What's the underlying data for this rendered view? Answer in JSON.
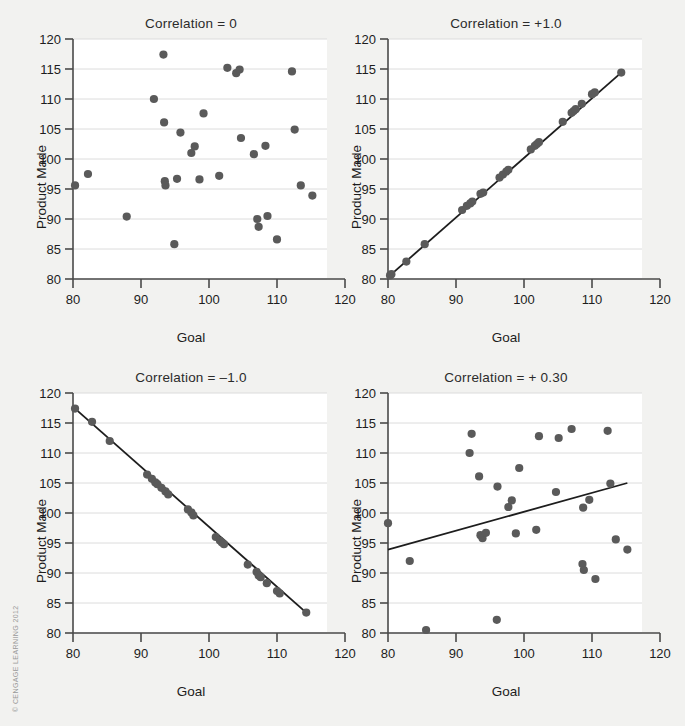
{
  "figure": {
    "background_color": "#f2f2f0",
    "plot_background_color": "#ffffff",
    "point_color": "#5a5a5a",
    "line_color": "#1d1d1d",
    "grid_color": "#dcdcdc",
    "axis_color": "#4a4a4a",
    "credit": "© CENGAGE LEARNING 2012"
  },
  "axes": {
    "xlabel": "Goal",
    "ylabel": "Product Made",
    "xticks": [
      80,
      90,
      100,
      110,
      120
    ],
    "yticks": [
      80,
      85,
      90,
      95,
      100,
      105,
      110,
      115,
      120
    ],
    "xlim": [
      80,
      120
    ],
    "ylim": [
      80,
      120
    ]
  },
  "chart_data": [
    {
      "type": "scatter",
      "title": "Correlation = 0",
      "xlabel": "Goal",
      "ylabel": "Product Made",
      "xlim": [
        80,
        120
      ],
      "ylim": [
        80,
        120
      ],
      "xticks": [
        80,
        90,
        100,
        110,
        120
      ],
      "yticks": [
        80,
        85,
        90,
        95,
        100,
        105,
        110,
        115,
        120
      ],
      "grid": "horizontal",
      "legend": "none",
      "correlation": 0,
      "trendline": null,
      "points": [
        [
          80.3,
          95.6
        ],
        [
          82.2,
          97.5
        ],
        [
          87.9,
          90.4
        ],
        [
          91.9,
          110.0
        ],
        [
          93.3,
          117.4
        ],
        [
          93.4,
          106.1
        ],
        [
          93.5,
          96.3
        ],
        [
          93.6,
          95.6
        ],
        [
          94.9,
          85.8
        ],
        [
          95.3,
          96.7
        ],
        [
          95.8,
          104.4
        ],
        [
          97.4,
          101.0
        ],
        [
          97.9,
          102.1
        ],
        [
          98.6,
          96.6
        ],
        [
          99.2,
          107.6
        ],
        [
          101.5,
          97.2
        ],
        [
          102.7,
          115.2
        ],
        [
          104.0,
          114.3
        ],
        [
          104.5,
          114.9
        ],
        [
          104.7,
          103.5
        ],
        [
          106.6,
          100.8
        ],
        [
          107.1,
          90.0
        ],
        [
          107.3,
          88.7
        ],
        [
          108.3,
          102.2
        ],
        [
          108.6,
          90.5
        ],
        [
          110.0,
          86.6
        ],
        [
          112.2,
          114.6
        ],
        [
          112.6,
          104.9
        ],
        [
          113.5,
          95.6
        ],
        [
          115.2,
          93.9
        ]
      ]
    },
    {
      "type": "scatter",
      "title": "Correlation = +1.0",
      "xlabel": "Goal",
      "ylabel": "Product Made",
      "xlim": [
        80,
        120
      ],
      "ylim": [
        80,
        120
      ],
      "xticks": [
        80,
        90,
        100,
        110,
        120
      ],
      "yticks": [
        80,
        85,
        90,
        95,
        100,
        105,
        110,
        115,
        120
      ],
      "grid": "horizontal",
      "legend": "none",
      "correlation": 1.0,
      "trendline": {
        "x": [
          80.3,
          114.3
        ],
        "y": [
          80.6,
          114.4
        ]
      },
      "points": [
        [
          80.3,
          80.6
        ],
        [
          80.5,
          80.8
        ],
        [
          82.7,
          82.9
        ],
        [
          85.4,
          85.8
        ],
        [
          90.9,
          91.5
        ],
        [
          91.6,
          92.2
        ],
        [
          92.1,
          92.6
        ],
        [
          92.4,
          92.9
        ],
        [
          93.6,
          94.2
        ],
        [
          94.0,
          94.4
        ],
        [
          96.4,
          96.9
        ],
        [
          96.9,
          97.4
        ],
        [
          97.4,
          97.9
        ],
        [
          97.7,
          98.2
        ],
        [
          101.0,
          101.6
        ],
        [
          101.6,
          102.2
        ],
        [
          101.9,
          102.5
        ],
        [
          102.2,
          102.8
        ],
        [
          105.7,
          106.2
        ],
        [
          107.0,
          107.7
        ],
        [
          107.3,
          108.0
        ],
        [
          107.6,
          108.3
        ],
        [
          108.5,
          109.2
        ],
        [
          110.0,
          110.8
        ],
        [
          110.4,
          111.1
        ],
        [
          114.3,
          114.4
        ]
      ]
    },
    {
      "type": "scatter",
      "title": "Correlation = –1.0",
      "xlabel": "Goal",
      "ylabel": "Product Made",
      "xlim": [
        80,
        120
      ],
      "ylim": [
        80,
        120
      ],
      "xticks": [
        80,
        90,
        100,
        110,
        120
      ],
      "yticks": [
        80,
        85,
        90,
        95,
        100,
        105,
        110,
        115,
        120
      ],
      "grid": "horizontal",
      "legend": "none",
      "correlation": -1.0,
      "trendline": {
        "x": [
          80.3,
          114.3
        ],
        "y": [
          117.4,
          83.4
        ]
      },
      "points": [
        [
          80.3,
          117.4
        ],
        [
          82.8,
          115.2
        ],
        [
          85.4,
          112.0
        ],
        [
          90.9,
          106.4
        ],
        [
          91.6,
          105.7
        ],
        [
          92.1,
          105.1
        ],
        [
          92.4,
          104.8
        ],
        [
          93.0,
          104.2
        ],
        [
          93.6,
          103.6
        ],
        [
          94.0,
          103.1
        ],
        [
          96.9,
          100.6
        ],
        [
          97.4,
          100.1
        ],
        [
          97.7,
          99.6
        ],
        [
          101.0,
          96.0
        ],
        [
          101.6,
          95.4
        ],
        [
          101.9,
          95.1
        ],
        [
          102.2,
          94.8
        ],
        [
          105.7,
          91.4
        ],
        [
          107.0,
          90.2
        ],
        [
          107.3,
          89.6
        ],
        [
          107.6,
          89.3
        ],
        [
          108.5,
          88.3
        ],
        [
          110.0,
          87.0
        ],
        [
          110.4,
          86.6
        ],
        [
          114.3,
          83.4
        ]
      ]
    },
    {
      "type": "scatter",
      "title": "Correlation = + 0.30",
      "xlabel": "Goal",
      "ylabel": "Product Made",
      "xlim": [
        80,
        120
      ],
      "ylim": [
        80,
        120
      ],
      "xticks": [
        80,
        90,
        100,
        110,
        120
      ],
      "yticks": [
        80,
        85,
        90,
        95,
        100,
        105,
        110,
        115,
        120
      ],
      "grid": "horizontal",
      "legend": "none",
      "correlation": 0.3,
      "trendline": {
        "x": [
          80.0,
          115.2
        ],
        "y": [
          93.9,
          105.0
        ]
      },
      "points": [
        [
          80.0,
          98.3
        ],
        [
          83.2,
          92.0
        ],
        [
          85.6,
          80.5
        ],
        [
          92.0,
          110.0
        ],
        [
          92.3,
          113.2
        ],
        [
          93.4,
          106.1
        ],
        [
          93.6,
          96.3
        ],
        [
          93.9,
          95.8
        ],
        [
          94.4,
          96.7
        ],
        [
          96.0,
          82.2
        ],
        [
          96.1,
          104.4
        ],
        [
          97.7,
          101.0
        ],
        [
          98.2,
          102.1
        ],
        [
          98.8,
          96.6
        ],
        [
          99.3,
          107.5
        ],
        [
          101.8,
          97.2
        ],
        [
          102.2,
          112.8
        ],
        [
          104.7,
          103.5
        ],
        [
          105.1,
          112.5
        ],
        [
          107.0,
          114.0
        ],
        [
          108.6,
          91.5
        ],
        [
          108.7,
          100.9
        ],
        [
          108.8,
          90.5
        ],
        [
          109.6,
          102.2
        ],
        [
          110.5,
          89.0
        ],
        [
          112.3,
          113.7
        ],
        [
          112.7,
          104.9
        ],
        [
          113.5,
          95.6
        ],
        [
          115.2,
          93.9
        ]
      ]
    }
  ],
  "panels": [
    {
      "name": "top-left",
      "title": "Correlation = 0",
      "x": 26,
      "y": 14
    },
    {
      "name": "top-right",
      "title": "Correlation = +1.0",
      "x": 341,
      "y": 14
    },
    {
      "name": "bottom-left",
      "title": "Correlation = –1.0",
      "x": 26,
      "y": 368
    },
    {
      "name": "bottom-right",
      "title": "Correlation = + 0.30",
      "x": 341,
      "y": 368
    }
  ]
}
